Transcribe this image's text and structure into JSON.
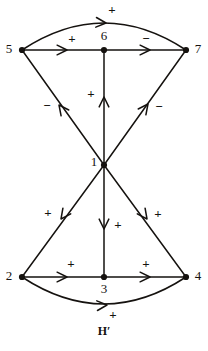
{
  "figure": {
    "caption": "H′",
    "caption_x": 104,
    "caption_y": 332,
    "background": "#ffffff",
    "ink": "#15120f"
  },
  "graph_data": {
    "type": "diagram",
    "title": "H′",
    "description": "Signed directed graph (bipartite-like hourglass) with 7 vertices and 10 arcs labelled + or -",
    "vertices": [
      {
        "id": "1",
        "label": "1",
        "x": 104,
        "y": 165,
        "label_x": 94,
        "label_y": 163
      },
      {
        "id": "2",
        "label": "2",
        "x": 22,
        "y": 277,
        "label_x": 9,
        "label_y": 277
      },
      {
        "id": "3",
        "label": "3",
        "x": 104,
        "y": 277,
        "label_x": 104,
        "label_y": 290
      },
      {
        "id": "4",
        "label": "4",
        "x": 186,
        "y": 277,
        "label_x": 198,
        "label_y": 277
      },
      {
        "id": "5",
        "label": "5",
        "x": 22,
        "y": 50,
        "label_x": 9,
        "label_y": 50
      },
      {
        "id": "6",
        "label": "6",
        "x": 104,
        "y": 50,
        "label_x": 104,
        "label_y": 37
      },
      {
        "id": "7",
        "label": "7",
        "x": 186,
        "y": 50,
        "label_x": 198,
        "label_y": 50
      }
    ],
    "edges": [
      {
        "id": "e-5-6",
        "from": "5",
        "to": "6",
        "sign": "+",
        "shape": "straight",
        "sign_x": 72,
        "sign_y": 40
      },
      {
        "id": "e-6-7",
        "from": "6",
        "to": "7",
        "sign": "−",
        "shape": "straight",
        "sign_x": 146,
        "sign_y": 40
      },
      {
        "id": "e-5-7",
        "from": "5",
        "to": "7",
        "sign": "+",
        "shape": "arc-up",
        "sign_x": 112,
        "sign_y": 11
      },
      {
        "id": "e-1-5",
        "from": "1",
        "to": "5",
        "sign": "−",
        "shape": "straight",
        "sign_x": 47,
        "sign_y": 107
      },
      {
        "id": "e-1-6",
        "from": "1",
        "to": "6",
        "sign": "+",
        "shape": "straight",
        "sign_x": 91,
        "sign_y": 95
      },
      {
        "id": "e-1-7",
        "from": "1",
        "to": "7",
        "sign": "−",
        "shape": "straight",
        "sign_x": 159,
        "sign_y": 108
      },
      {
        "id": "e-1-2",
        "from": "1",
        "to": "2",
        "sign": "+",
        "shape": "straight",
        "sign_x": 48,
        "sign_y": 214
      },
      {
        "id": "e-1-3",
        "from": "1",
        "to": "3",
        "sign": "+",
        "shape": "straight",
        "sign_x": 118,
        "sign_y": 226
      },
      {
        "id": "e-1-4",
        "from": "1",
        "to": "4",
        "sign": "+",
        "shape": "straight",
        "sign_x": 158,
        "sign_y": 215
      },
      {
        "id": "e-2-3",
        "from": "2",
        "to": "3",
        "sign": "+",
        "shape": "straight",
        "sign_x": 71,
        "sign_y": 265
      },
      {
        "id": "e-3-4",
        "from": "3",
        "to": "4",
        "sign": "+",
        "shape": "straight",
        "sign_x": 146,
        "sign_y": 265
      },
      {
        "id": "e-2-4",
        "from": "2",
        "to": "4",
        "sign": "+",
        "shape": "arc-down",
        "sign_x": 113,
        "sign_y": 316
      }
    ],
    "paths": {
      "arc_top": "M 22 50 Q 104 -4 186 50",
      "arc_bottom": "M 22 277 Q 104 331 186 277"
    },
    "arrowheads": [
      {
        "id": "ah-5-6",
        "edge": "e-5-6",
        "x": 67,
        "y": 50,
        "angle": 0
      },
      {
        "id": "ah-6-7",
        "edge": "e-6-7",
        "x": 150,
        "y": 50,
        "angle": 0
      },
      {
        "id": "ah-5-7",
        "edge": "e-5-7",
        "x": 106,
        "y": 23,
        "angle": 4
      },
      {
        "id": "ah-1-5",
        "edge": "e-1-5",
        "x": 59,
        "y": 105,
        "angle": 233
      },
      {
        "id": "ah-1-6",
        "edge": "e-1-6",
        "x": 104,
        "y": 97,
        "angle": 270
      },
      {
        "id": "ah-1-7",
        "edge": "e-1-7",
        "x": 148,
        "y": 104,
        "angle": 307
      },
      {
        "id": "ah-1-2",
        "edge": "e-1-2",
        "x": 61,
        "y": 219,
        "angle": 126
      },
      {
        "id": "ah-1-3",
        "edge": "e-1-3",
        "x": 104,
        "y": 229,
        "angle": 90
      },
      {
        "id": "ah-1-4",
        "edge": "e-1-4",
        "x": 147,
        "y": 219,
        "angle": 54
      },
      {
        "id": "ah-2-3",
        "edge": "e-2-3",
        "x": 67,
        "y": 277,
        "angle": 0
      },
      {
        "id": "ah-3-4",
        "edge": "e-3-4",
        "x": 150,
        "y": 277,
        "angle": 0
      },
      {
        "id": "ah-2-4",
        "edge": "e-2-4",
        "x": 107,
        "y": 305,
        "angle": -4
      }
    ]
  }
}
